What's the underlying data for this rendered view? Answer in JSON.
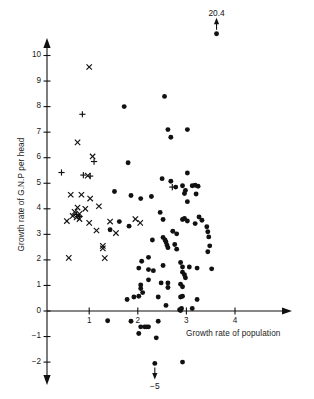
{
  "chart_data": {
    "type": "scatter",
    "title": "",
    "xlabel": "Growth rate of population",
    "ylabel": "Growth rate of G.N.P per head",
    "xlim": [
      -0.15,
      4.65
    ],
    "ylim": [
      -2.75,
      10.9
    ],
    "grid": false,
    "legend": null,
    "xticks": [
      1,
      2,
      3,
      4
    ],
    "xtick_labels": [
      "1",
      "2",
      "3",
      "4"
    ],
    "yticks": [
      -2,
      -1,
      0,
      1,
      2,
      3,
      4,
      5,
      6,
      7,
      8,
      9,
      10
    ],
    "ytick_labels": [
      "−2",
      "−1",
      "0",
      "1",
      "2",
      "3",
      "4",
      "5",
      "6",
      "7",
      "8",
      "9",
      "10"
    ],
    "annotations": [
      {
        "text": "20.4",
        "x": 3.62,
        "y": 11.6,
        "arrow": "up",
        "marker_y": 10.85,
        "note": "off-scale point clipped above axis"
      },
      {
        "text": "−5",
        "x": 2.35,
        "y": -3.35,
        "arrow": "down",
        "marker_y": -2.05,
        "note": "off-scale point clipped below axis"
      }
    ],
    "series": [
      {
        "name": "cross-marks",
        "marker": "x",
        "color": "#111111",
        "points": [
          [
            1.0,
            9.55
          ],
          [
            0.76,
            6.6
          ],
          [
            1.07,
            6.05
          ],
          [
            0.97,
            5.3
          ],
          [
            0.62,
            4.55
          ],
          [
            0.84,
            4.55
          ],
          [
            1.02,
            4.4
          ],
          [
            1.2,
            4.1
          ],
          [
            0.76,
            4.05
          ],
          [
            0.92,
            4.0
          ],
          [
            0.7,
            3.88
          ],
          [
            0.8,
            3.8
          ],
          [
            0.66,
            3.72
          ],
          [
            0.74,
            3.66
          ],
          [
            0.8,
            3.6
          ],
          [
            0.54,
            3.52
          ],
          [
            1.0,
            3.45
          ],
          [
            1.43,
            3.5
          ],
          [
            1.15,
            3.15
          ],
          [
            1.28,
            2.55
          ],
          [
            1.28,
            2.45
          ],
          [
            1.55,
            3.05
          ],
          [
            0.58,
            2.08
          ],
          [
            1.32,
            2.07
          ],
          [
            1.95,
            3.6
          ],
          [
            2.05,
            3.45
          ]
        ]
      },
      {
        "name": "plus-marks",
        "marker": "+",
        "color": "#111111",
        "points": [
          [
            0.86,
            7.7
          ],
          [
            1.1,
            5.85
          ],
          [
            0.43,
            5.42
          ],
          [
            0.88,
            5.32
          ],
          [
            1.02,
            5.28
          ],
          [
            0.74,
            3.78
          ],
          [
            0.8,
            3.7
          ],
          [
            2.71,
            4.85
          ]
        ]
      },
      {
        "name": "dot-marks",
        "marker": "o",
        "color": "#111111",
        "points": [
          [
            2.55,
            8.4
          ],
          [
            1.72,
            8.0
          ],
          [
            2.62,
            7.1
          ],
          [
            3.02,
            7.1
          ],
          [
            2.68,
            6.8
          ],
          [
            1.8,
            5.8
          ],
          [
            3.02,
            5.4
          ],
          [
            2.5,
            5.18
          ],
          [
            2.68,
            5.08
          ],
          [
            3.12,
            4.9
          ],
          [
            3.18,
            4.92
          ],
          [
            3.24,
            4.88
          ],
          [
            2.96,
            4.6
          ],
          [
            3.2,
            4.58
          ],
          [
            1.52,
            4.68
          ],
          [
            1.86,
            4.52
          ],
          [
            2.06,
            4.4
          ],
          [
            2.28,
            4.48
          ],
          [
            2.78,
            4.85
          ],
          [
            2.92,
            4.9
          ],
          [
            2.98,
            4.72
          ],
          [
            3.02,
            4.28
          ],
          [
            3.26,
            3.68
          ],
          [
            2.92,
            3.58
          ],
          [
            2.96,
            3.62
          ],
          [
            3.02,
            3.52
          ],
          [
            3.18,
            3.42
          ],
          [
            3.32,
            3.55
          ],
          [
            3.42,
            3.3
          ],
          [
            3.44,
            3.1
          ],
          [
            3.46,
            2.9
          ],
          [
            3.48,
            2.55
          ],
          [
            3.44,
            2.32
          ],
          [
            2.46,
            3.86
          ],
          [
            2.52,
            3.58
          ],
          [
            2.72,
            3.12
          ],
          [
            2.8,
            3.02
          ],
          [
            2.52,
            2.88
          ],
          [
            2.56,
            2.78
          ],
          [
            2.58,
            2.7
          ],
          [
            2.6,
            2.58
          ],
          [
            2.62,
            2.48
          ],
          [
            2.76,
            2.6
          ],
          [
            2.8,
            2.42
          ],
          [
            2.3,
            2.78
          ],
          [
            2.22,
            2.1
          ],
          [
            1.43,
            3.18
          ],
          [
            1.62,
            3.5
          ],
          [
            1.82,
            3.32
          ],
          [
            2.08,
            1.95
          ],
          [
            2.02,
            1.68
          ],
          [
            2.22,
            1.62
          ],
          [
            2.32,
            1.58
          ],
          [
            2.52,
            1.78
          ],
          [
            2.92,
            1.72
          ],
          [
            3.06,
            1.72
          ],
          [
            3.22,
            1.68
          ],
          [
            3.52,
            1.65
          ],
          [
            2.88,
            1.9
          ],
          [
            2.92,
            1.52
          ],
          [
            2.96,
            1.42
          ],
          [
            2.98,
            1.3
          ],
          [
            2.22,
            1.22
          ],
          [
            2.48,
            1.1
          ],
          [
            2.62,
            1.1
          ],
          [
            2.62,
            0.92
          ],
          [
            2.88,
            1.05
          ],
          [
            2.92,
            0.95
          ],
          [
            2.06,
            1.02
          ],
          [
            2.06,
            0.88
          ],
          [
            2.1,
            0.72
          ],
          [
            1.78,
            0.45
          ],
          [
            1.92,
            0.55
          ],
          [
            2.02,
            0.58
          ],
          [
            2.42,
            0.55
          ],
          [
            2.58,
            0.22
          ],
          [
            2.88,
            0.55
          ],
          [
            2.92,
            0.58
          ],
          [
            3.22,
            0.45
          ],
          [
            2.86,
            0.05
          ],
          [
            2.88,
            0.02
          ],
          [
            2.9,
            0.1
          ],
          [
            3.12,
            0.1
          ],
          [
            1.38,
            -0.38
          ],
          [
            1.86,
            -0.4
          ],
          [
            2.42,
            -0.4
          ],
          [
            2.06,
            -0.62
          ],
          [
            2.14,
            -0.62
          ],
          [
            2.18,
            -0.62
          ],
          [
            2.22,
            -0.62
          ],
          [
            2.02,
            -0.88
          ],
          [
            2.38,
            -1.05
          ],
          [
            2.35,
            -2.05
          ],
          [
            2.92,
            -2.0
          ],
          [
            3.62,
            10.85
          ]
        ]
      }
    ]
  },
  "axes": {
    "x_arrow": "right",
    "y_arrow_up": true,
    "y_arrow_down": true
  }
}
